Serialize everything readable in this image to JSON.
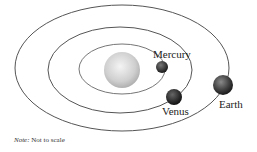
{
  "diagram": {
    "labels": {
      "mercury": "Mercury",
      "venus": "Venus",
      "earth": "Earth"
    },
    "note": {
      "prefix": "Note:",
      "text": " Not to scale"
    },
    "bodies": [
      {
        "name": "Sun",
        "cx": 122,
        "cy": 70,
        "r": 18
      },
      {
        "name": "Mercury",
        "cx": 162,
        "cy": 67,
        "r": 6
      },
      {
        "name": "Venus",
        "cx": 174,
        "cy": 97,
        "r": 8
      },
      {
        "name": "Earth",
        "cx": 223,
        "cy": 85,
        "r": 10
      }
    ],
    "orbits": [
      {
        "name": "Mercury orbit",
        "cx": 122,
        "cy": 69,
        "rx": 43,
        "ry": 25
      },
      {
        "name": "Venus orbit",
        "cx": 120,
        "cy": 70,
        "rx": 72,
        "ry": 43
      },
      {
        "name": "Earth orbit",
        "cx": 122,
        "cy": 68,
        "rx": 107,
        "ry": 63
      }
    ],
    "colors": {
      "orbit": "#555555",
      "sun_light": "#f2f2f2",
      "sun_dark": "#b8b8b8",
      "planet_dark": "#1a1a1a",
      "planet_mid": "#555555"
    }
  }
}
